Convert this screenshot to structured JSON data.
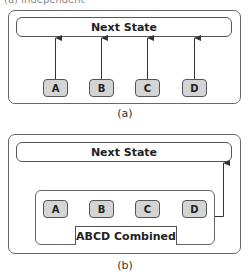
{
  "diagram_a": {
    "header_partial": "(a) Independent",
    "target_label": "Next State",
    "variables": [
      "A",
      "B",
      "C",
      "D"
    ],
    "caption": "(a)"
  },
  "diagram_b": {
    "target_label": "Next State",
    "variables": [
      "A",
      "B",
      "C",
      "D"
    ],
    "group_label": "ABCD Combined",
    "caption": "(b)"
  },
  "colors": {
    "variable_fill": "#d4d4d4",
    "stroke": "#555555",
    "background": "#ffffff"
  }
}
